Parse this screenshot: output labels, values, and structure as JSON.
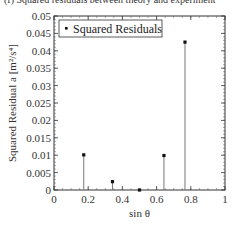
{
  "caption": "(f) Squared residuals between theory and experiment",
  "chart_data": {
    "type": "stem",
    "title": "",
    "xlabel": "sin θ",
    "ylabel": "Squared Residual a [m²/s⁴]",
    "xlim": [
      0,
      1
    ],
    "ylim": [
      0,
      0.05
    ],
    "xticks": [
      "0",
      "0.2",
      "0.4",
      "0.6",
      "0.8",
      "1"
    ],
    "yticks": [
      "0",
      "0.005",
      "0.01",
      "0.015",
      "0.02",
      "0.025",
      "0.03",
      "0.035",
      "0.04",
      "0.045",
      "0.05"
    ],
    "grid": false,
    "legend_position": "upper left",
    "series": [
      {
        "name": "Squared Residuals",
        "x": [
          0.174,
          0.342,
          0.5,
          0.643,
          0.766
        ],
        "values": [
          0.0101,
          0.0024,
          0.0,
          0.0099,
          0.0425
        ]
      }
    ]
  },
  "legend": {
    "label": "Squared Residuals"
  }
}
